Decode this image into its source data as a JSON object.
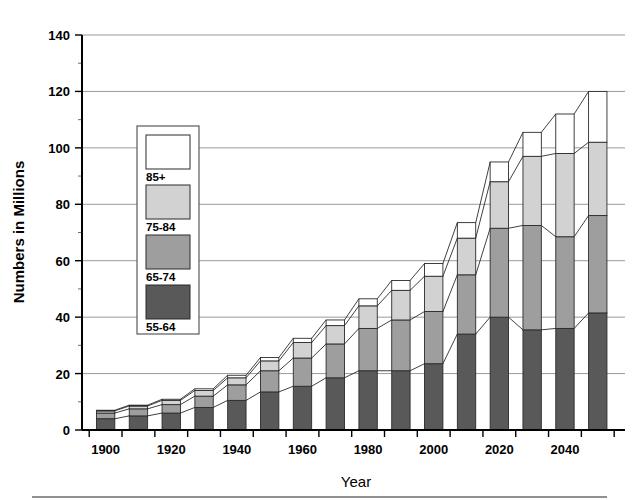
{
  "chart_data": {
    "type": "bar",
    "title": "",
    "subtitle": "",
    "xlabel": "Year",
    "ylabel": "Numbers in Millions",
    "stacked": true,
    "grid": true,
    "legend_position": "inside-upper-left",
    "xlim": [
      1895,
      2055
    ],
    "ylim": [
      0,
      140
    ],
    "ytick_step": 20,
    "yminor_step": 10,
    "xtick_step": 10,
    "xlabel_step": 20,
    "yticks": [
      0,
      20,
      40,
      60,
      80,
      100,
      120,
      140
    ],
    "ytick_labels": [
      "0",
      "20",
      "40",
      "60",
      "80",
      "100",
      "120",
      "140"
    ],
    "categories": [
      1900,
      1910,
      1920,
      1930,
      1940,
      1950,
      1960,
      1970,
      1980,
      1990,
      2000,
      2010,
      2020,
      2030,
      2040,
      2050
    ],
    "xtick_labels": [
      "1900",
      "",
      "1920",
      "",
      "1940",
      "",
      "1960",
      "",
      "1980",
      "",
      "2000",
      "",
      "2020",
      "",
      "2040",
      ""
    ],
    "series": [
      {
        "name": "55-64",
        "color": "#595959",
        "values": [
          4.0,
          5.0,
          6.0,
          8.0,
          10.5,
          13.5,
          15.5,
          18.5,
          21.0,
          21.0,
          23.5,
          34.0,
          40.0,
          35.5,
          36.0,
          41.5
        ]
      },
      {
        "name": "65-74",
        "color": "#9e9e9e",
        "values": [
          2.0,
          2.5,
          3.0,
          4.0,
          5.5,
          7.5,
          10.0,
          12.0,
          15.0,
          18.0,
          18.5,
          21.0,
          31.5,
          37.0,
          32.5,
          34.5
        ]
      },
      {
        "name": "75-84",
        "color": "#d2d2d2",
        "values": [
          0.8,
          1.0,
          1.5,
          2.0,
          2.5,
          3.5,
          5.5,
          6.5,
          8.0,
          10.5,
          12.5,
          13.0,
          16.5,
          24.5,
          29.5,
          26.0
        ]
      },
      {
        "name": "85+",
        "color": "#ffffff",
        "values": [
          0.2,
          0.3,
          0.4,
          0.6,
          0.9,
          1.2,
          1.5,
          2.0,
          2.5,
          3.5,
          4.5,
          5.5,
          7.0,
          8.5,
          14.0,
          18.0
        ]
      }
    ],
    "totals": [
      7.0,
      8.8,
      10.9,
      14.6,
      19.4,
      25.7,
      32.5,
      39.0,
      46.5,
      53.0,
      59.0,
      73.5,
      95.0,
      105.5,
      112.0,
      120.0
    ],
    "legend": {
      "entries": [
        {
          "label": "85+",
          "color": "#ffffff"
        },
        {
          "label": "75-84",
          "color": "#d2d2d2"
        },
        {
          "label": "65-74",
          "color": "#9e9e9e"
        },
        {
          "label": "55-64",
          "color": "#595959"
        }
      ]
    }
  }
}
